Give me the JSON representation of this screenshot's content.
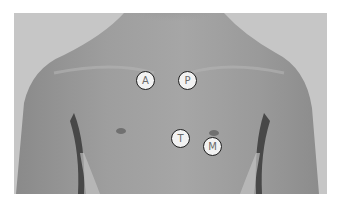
{
  "figure": {
    "markers": [
      {
        "label": "A",
        "x": 146,
        "y": 81
      },
      {
        "label": "P",
        "x": 188,
        "y": 81
      },
      {
        "label": "T",
        "x": 181,
        "y": 139
      },
      {
        "label": "M",
        "x": 213,
        "y": 147
      }
    ],
    "colors": {
      "background": "#c4c4c4",
      "skin_light": "#a8a8a8",
      "skin_dark": "#6e6e6e",
      "marker_fill": "#f2f2f2",
      "marker_border": "#1e1e1e",
      "marker_text": "#6a6a6a"
    }
  }
}
